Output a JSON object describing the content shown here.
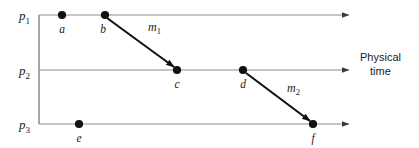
{
  "figure": {
    "kind": "space-time-diagram",
    "caption_lines": [
      "Physical",
      "time"
    ],
    "colors": {
      "background": "#ffffff",
      "axis": "#8c8c8c",
      "message_arrow": "#111111",
      "event_dot": "#111111",
      "text": "#1a1a1a"
    }
  },
  "processes": [
    {
      "id": "p1",
      "base": "p",
      "subscript": "1",
      "label": "p₁",
      "y": 15,
      "x_start": 39,
      "x_end": 352
    },
    {
      "id": "p2",
      "base": "p",
      "subscript": "2",
      "label": "p₂",
      "y": 70,
      "x_start": 39,
      "x_end": 352
    },
    {
      "id": "p3",
      "base": "p",
      "subscript": "3",
      "label": "p₃",
      "y": 124,
      "x_start": 39,
      "x_end": 352
    }
  ],
  "vertical_connector": {
    "x": 39,
    "y_top": 15,
    "y_bottom": 124
  },
  "events": [
    {
      "id": "a",
      "label": "a",
      "process": "p1",
      "x": 62,
      "y": 15,
      "label_x": 62,
      "label_y": 33
    },
    {
      "id": "b",
      "label": "b",
      "process": "p1",
      "x": 105,
      "y": 15,
      "label_x": 103,
      "label_y": 33
    },
    {
      "id": "c",
      "label": "c",
      "process": "p2",
      "x": 177,
      "y": 70,
      "label_x": 177,
      "label_y": 88
    },
    {
      "id": "d",
      "label": "d",
      "process": "p2",
      "x": 243,
      "y": 70,
      "label_x": 243,
      "label_y": 88
    },
    {
      "id": "e",
      "label": "e",
      "process": "p3",
      "x": 79,
      "y": 124,
      "label_x": 79,
      "label_y": 142
    },
    {
      "id": "f",
      "label": "f",
      "process": "p3",
      "x": 313,
      "y": 124,
      "label_x": 313,
      "label_y": 142
    }
  ],
  "messages": [
    {
      "id": "m1",
      "base": "m",
      "subscript": "1",
      "label": "m₁",
      "from_event": "b",
      "to_event": "c",
      "x1": 107,
      "y1": 18,
      "x2": 174,
      "y2": 67,
      "label_x": 148,
      "label_y": 31
    },
    {
      "id": "m2",
      "base": "m",
      "subscript": "2",
      "label": "m₂",
      "from_event": "d",
      "to_event": "f",
      "x1": 246,
      "y1": 73,
      "x2": 310,
      "y2": 121,
      "label_x": 287,
      "label_y": 92
    }
  ],
  "caption": {
    "x": 360,
    "y_line1": 61,
    "y_line2": 75
  }
}
